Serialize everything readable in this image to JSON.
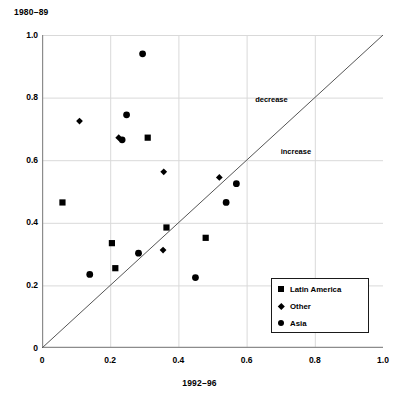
{
  "chart_data": {
    "type": "scatter",
    "title": "",
    "xlabel": "1992–96",
    "ylabel": "1980–89",
    "xlim": [
      0,
      1.0
    ],
    "ylim": [
      0,
      1.0
    ],
    "grid": true,
    "xticks": [
      "0",
      "0.2",
      "0.4",
      "0.6",
      "0.8",
      "1.0"
    ],
    "xtick_values": [
      0,
      0.2,
      0.4,
      0.6,
      0.8,
      1.0
    ],
    "yticks": [
      "0",
      "0.2",
      "0.4",
      "0.6",
      "0.8",
      "1.0"
    ],
    "ytick_values": [
      0,
      0.2,
      0.4,
      0.6,
      0.8,
      1.0
    ],
    "legend_position": "lower-right",
    "reference_line": {
      "name": "y = x diagonal",
      "from": [
        0,
        0
      ],
      "to": [
        1.0,
        1.0
      ],
      "color": "#555555"
    },
    "annotations": [
      {
        "text": "decrease",
        "x": 0.625,
        "y": 0.793,
        "name": "decrease-label"
      },
      {
        "text": "increase",
        "x": 0.7,
        "y": 0.625,
        "name": "increase-label"
      }
    ],
    "series": [
      {
        "name": "Latin America",
        "marker": "square",
        "color": "#000000",
        "points": [
          [
            0.06,
            0.465
          ],
          [
            0.205,
            0.335
          ],
          [
            0.215,
            0.255
          ],
          [
            0.31,
            0.672
          ],
          [
            0.365,
            0.385
          ],
          [
            0.48,
            0.352
          ]
        ]
      },
      {
        "name": "Other",
        "marker": "diamond",
        "color": "#000000",
        "points": [
          [
            0.11,
            0.725
          ],
          [
            0.225,
            0.672
          ],
          [
            0.357,
            0.563
          ],
          [
            0.355,
            0.313
          ],
          [
            0.52,
            0.545
          ]
        ]
      },
      {
        "name": "Asia",
        "marker": "circle",
        "color": "#000000",
        "points": [
          [
            0.295,
            0.94
          ],
          [
            0.248,
            0.745
          ],
          [
            0.235,
            0.665
          ],
          [
            0.14,
            0.235
          ],
          [
            0.283,
            0.303
          ],
          [
            0.45,
            0.225
          ],
          [
            0.54,
            0.465
          ],
          [
            0.57,
            0.525
          ]
        ]
      }
    ]
  },
  "legend": {
    "entries": [
      {
        "label": "Latin America",
        "marker": "square"
      },
      {
        "label": "Other",
        "marker": "diamond"
      },
      {
        "label": "Asia",
        "marker": "circle"
      }
    ]
  },
  "colors": {
    "axis": "#8c8c8c",
    "grid": "#d9d9d9",
    "marker": "#000000",
    "reference_line": "#555555",
    "text": "#000000"
  }
}
